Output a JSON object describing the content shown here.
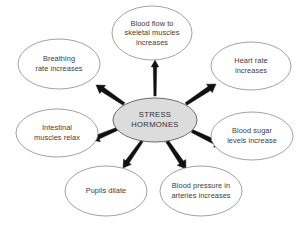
{
  "diagram": {
    "type": "radial-hub-and-spoke",
    "background_color": "#ffffff",
    "center": {
      "id": "stress-hormones",
      "label": "STRESS\nHORMONES",
      "fill_color": "#dcdcdc",
      "stroke_color": "#6b6b6b",
      "cx": 155,
      "cy": 120,
      "rx": 42,
      "ry": 22
    },
    "arrow_color": "#111111",
    "node_fill_color": "#ffffff",
    "node_stroke_color": "#8a8a8a",
    "text_color": "#3c3c3c",
    "nodes": [
      {
        "id": "blood-flow-skeletal-muscles",
        "label": "Blood flow to\nskeletal muscles\nincreases",
        "cx": 152,
        "cy": 33,
        "rx": 40,
        "ry": 27,
        "angle_deg": -90
      },
      {
        "id": "heart-rate",
        "label": "Heart rate\nincreases",
        "cx": 251,
        "cy": 66,
        "rx": 40,
        "ry": 24,
        "angle_deg": -36
      },
      {
        "id": "blood-sugar-levels",
        "label": "Blood sugar\nlevels increase",
        "cx": 252,
        "cy": 136,
        "rx": 41,
        "ry": 24,
        "angle_deg": 22
      },
      {
        "id": "blood-pressure-arteries",
        "label": "Blood pressure in\narteries increases",
        "cx": 201,
        "cy": 191,
        "rx": 41,
        "ry": 25,
        "angle_deg": 70
      },
      {
        "id": "pupils-dilate",
        "label": "Pupils dilate",
        "cx": 106,
        "cy": 191,
        "rx": 41,
        "ry": 25,
        "angle_deg": 112
      },
      {
        "id": "intestinal-muscles",
        "label": "Intestinal\nmuscles relax",
        "cx": 57,
        "cy": 133,
        "rx": 41,
        "ry": 24,
        "angle_deg": 160
      },
      {
        "id": "breathing-rate",
        "label": "Breathing\nrate increases",
        "cx": 59,
        "cy": 64,
        "rx": 41,
        "ry": 25,
        "angle_deg": -145
      }
    ],
    "arrows": [
      {
        "id": "arrow-to-blood-flow",
        "x1": 155,
        "y1": 96,
        "x2": 155,
        "y2": 60,
        "width": 3.4,
        "head": 7.0
      },
      {
        "id": "arrow-to-heart-rate",
        "x1": 186,
        "y1": 104,
        "x2": 216,
        "y2": 84,
        "width": 4.6,
        "head": 8.0
      },
      {
        "id": "arrow-to-blood-sugar",
        "x1": 192,
        "y1": 131,
        "x2": 223,
        "y2": 146,
        "width": 4.6,
        "head": 8.0
      },
      {
        "id": "arrow-to-blood-pressure",
        "x1": 167,
        "y1": 141,
        "x2": 186,
        "y2": 169,
        "width": 4.6,
        "head": 8.0
      },
      {
        "id": "arrow-to-pupils",
        "x1": 142,
        "y1": 141,
        "x2": 123,
        "y2": 168,
        "width": 4.2,
        "head": 7.6
      },
      {
        "id": "arrow-to-intestinal",
        "x1": 117,
        "y1": 129,
        "x2": 91,
        "y2": 140,
        "width": 4.6,
        "head": 8.0
      },
      {
        "id": "arrow-to-breathing",
        "x1": 124,
        "y1": 104,
        "x2": 96,
        "y2": 85,
        "width": 4.6,
        "head": 8.0
      }
    ]
  }
}
